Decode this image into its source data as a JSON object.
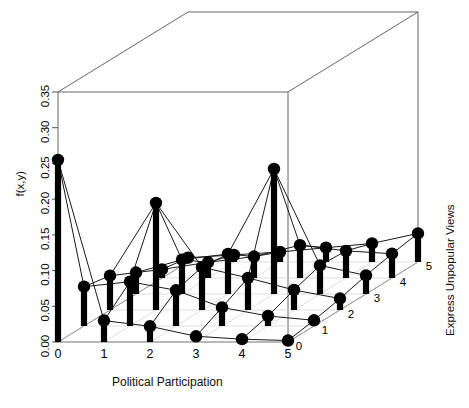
{
  "figure": {
    "title_partial": "",
    "type": "3d-stem-plot"
  },
  "axes": {
    "z": {
      "label": "f(x,y)",
      "ticks": [
        "0.00",
        "0.05",
        "0.10",
        "0.15",
        "0.20",
        "0.25",
        "0.30",
        "0.35"
      ],
      "min": 0.0,
      "max": 0.35
    },
    "x": {
      "label": "Political Participation",
      "ticks": [
        "0",
        "1",
        "2",
        "3",
        "4",
        "5"
      ],
      "min": 0,
      "max": 5
    },
    "y": {
      "label": "Express Unpopular Views",
      "ticks": [
        "0",
        "1",
        "2",
        "3",
        "4",
        "5"
      ],
      "min": 0,
      "max": 5
    }
  },
  "style": {
    "stem_color": "#000000",
    "point_color": "#000000",
    "mesh_color": "#1a1a1a",
    "box_color": "#555555",
    "background": "#ffffff"
  },
  "chart_data": {
    "type": "scatter",
    "title": "",
    "xlabel": "Political Participation",
    "ylabel": "Express Unpopular Views",
    "zlabel": "f(x,y)",
    "xlim": [
      0,
      5
    ],
    "ylim": [
      0,
      5
    ],
    "zlim": [
      0.0,
      0.35
    ],
    "grid": true,
    "legend": "none",
    "x": [
      0,
      1,
      2,
      3,
      4,
      5
    ],
    "y": [
      0,
      1,
      2,
      3,
      4,
      5
    ],
    "z_matrix": [
      [
        0.255,
        0.055,
        0.048,
        0.03,
        0.012,
        0.006
      ],
      [
        0.03,
        0.062,
        0.15,
        0.048,
        0.022,
        0.01
      ],
      [
        0.022,
        0.05,
        0.06,
        0.056,
        0.03,
        0.014
      ],
      [
        0.008,
        0.026,
        0.045,
        0.175,
        0.046,
        0.02
      ],
      [
        0.004,
        0.014,
        0.028,
        0.04,
        0.038,
        0.026
      ],
      [
        0.002,
        0.008,
        0.016,
        0.026,
        0.034,
        0.04
      ]
    ],
    "z_matrix_note": "rows = Political Participation 0..5, columns = Express Unpopular Views 0..5",
    "max_value": 0.255,
    "max_at": [
      0,
      0
    ]
  }
}
